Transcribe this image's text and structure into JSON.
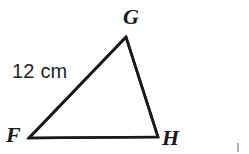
{
  "figure": {
    "kind": "geometry-diagram",
    "shape": "triangle",
    "background_color": "#ffffff",
    "stroke_color": "#1a1a1a",
    "stroke_width": 2.6,
    "canvas": {
      "width": 249,
      "height": 154
    },
    "vertices": [
      {
        "id": "F",
        "label": "F",
        "x": 29,
        "y": 138
      },
      {
        "id": "G",
        "label": "G",
        "x": 126,
        "y": 37
      },
      {
        "id": "H",
        "label": "H",
        "x": 158,
        "y": 137
      }
    ],
    "sides": [
      {
        "id": "FG",
        "from": "F",
        "to": "G",
        "measure": "12 cm"
      },
      {
        "id": "GH",
        "from": "G",
        "to": "H",
        "measure": ""
      },
      {
        "id": "FH",
        "from": "F",
        "to": "H",
        "measure": ""
      }
    ],
    "labels": {
      "vertex_G": "G",
      "vertex_F": "F",
      "vertex_H": "H",
      "side_FG_measure": "12 cm"
    }
  }
}
